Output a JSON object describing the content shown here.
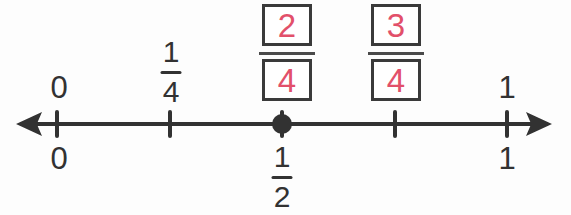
{
  "colors": {
    "ink": "#323232",
    "accent_pink": "#e2506a",
    "box_border": "#3a3a3a",
    "fraction_bar": "#4a4a4a",
    "background": "#fdfdfd"
  },
  "number_line": {
    "range": [
      0,
      1
    ],
    "tick_fractions": [
      0,
      0.25,
      0.5,
      0.75,
      1
    ],
    "point_fraction": 0.5
  },
  "labels": {
    "above": {
      "zero": "0",
      "one": "1",
      "quarter": {
        "numerator": "1",
        "denominator": "4"
      },
      "boxed_two_fourths": {
        "numerator": "2",
        "denominator": "4"
      },
      "boxed_three_fourths": {
        "numerator": "3",
        "denominator": "4"
      }
    },
    "below": {
      "zero": "0",
      "one": "1",
      "half": {
        "numerator": "1",
        "denominator": "2"
      }
    }
  }
}
